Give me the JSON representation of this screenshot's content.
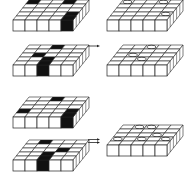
{
  "diagram": {
    "grid_size": 5,
    "colors": {
      "line": "#222222",
      "fill": "#ffffff",
      "dark": "#111111",
      "background": "#ffffff"
    },
    "left_slabs": [
      {
        "id": "slab-1",
        "ox": 13,
        "oy": 31,
        "dark_cells": [
          [
            0,
            0
          ],
          [
            3,
            0
          ],
          [
            4,
            3
          ]
        ],
        "dark_front": [
          4
        ]
      },
      {
        "id": "slab-2",
        "ox": 13,
        "oy": 76,
        "dark_cells": [
          [
            2,
            0
          ],
          [
            1,
            2
          ],
          [
            2,
            3
          ]
        ],
        "dark_front": [
          2
        ]
      },
      {
        "id": "slab-3",
        "ox": 13,
        "oy": 128,
        "dark_cells": [
          [
            2,
            0
          ],
          [
            0,
            3
          ],
          [
            4,
            3
          ]
        ],
        "dark_front": [
          4
        ]
      },
      {
        "id": "slab-4",
        "ox": 13,
        "oy": 171,
        "dark_cells": [
          [
            1,
            0
          ],
          [
            3,
            2
          ],
          [
            2,
            3
          ]
        ],
        "dark_front": [
          2
        ]
      }
    ],
    "right_slabs": [
      {
        "id": "result-1",
        "ox": 107,
        "oy": 31,
        "holes": [
          [
            0,
            0
          ],
          [
            3,
            0
          ],
          [
            4,
            3
          ]
        ]
      },
      {
        "id": "result-2",
        "ox": 107,
        "oy": 76,
        "holes": [
          [
            2,
            0
          ],
          [
            1,
            2
          ],
          [
            2,
            3
          ]
        ]
      },
      {
        "id": "result-3",
        "ox": 107,
        "oy": 156,
        "holes": [
          [
            1,
            0
          ],
          [
            2,
            0
          ],
          [
            0,
            3
          ],
          [
            3,
            2
          ],
          [
            4,
            3
          ],
          [
            2,
            3
          ]
        ]
      }
    ],
    "arrows": [
      {
        "id": "arrow-single",
        "type": "single",
        "x": 88,
        "y": 46
      },
      {
        "id": "arrow-double",
        "type": "double",
        "x": 88,
        "y": 141
      }
    ]
  }
}
